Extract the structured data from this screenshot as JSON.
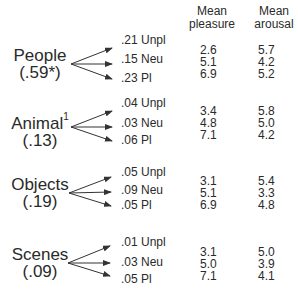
{
  "headers": {
    "pleasure": [
      "Mean",
      "pleasure"
    ],
    "arousal": [
      "Mean",
      "arousal"
    ]
  },
  "groups": [
    {
      "name": "People",
      "superscript": "",
      "proportion": "(.59*)",
      "branches": [
        {
          "prob": ".21",
          "label": "Unpl",
          "pleasure": "2.6",
          "arousal": "5.7"
        },
        {
          "prob": ".15",
          "label": "Neu",
          "pleasure": "5.1",
          "arousal": "4.2"
        },
        {
          "prob": ".23",
          "label": "Pl",
          "pleasure": "6.9",
          "arousal": "5.2"
        }
      ]
    },
    {
      "name": "Animal",
      "superscript": "1",
      "proportion": "(.13)",
      "branches": [
        {
          "prob": ".04",
          "label": "Unpl",
          "pleasure": "3.4",
          "arousal": "5.8"
        },
        {
          "prob": ".03",
          "label": "Neu",
          "pleasure": "4.8",
          "arousal": "5.0"
        },
        {
          "prob": ".06",
          "label": "Pl",
          "pleasure": "7.1",
          "arousal": "4.2"
        }
      ]
    },
    {
      "name": "Objects",
      "superscript": "",
      "proportion": "(.19)",
      "branches": [
        {
          "prob": ".05",
          "label": "Unpl",
          "pleasure": "3.1",
          "arousal": "5.4"
        },
        {
          "prob": ".09",
          "label": "Neu",
          "pleasure": "5.1",
          "arousal": "3.3"
        },
        {
          "prob": ".05",
          "label": "Pl",
          "pleasure": "6.9",
          "arousal": "4.8"
        }
      ]
    },
    {
      "name": "Scenes",
      "superscript": "",
      "proportion": "(.09)",
      "branches": [
        {
          "prob": ".01",
          "label": "Unpl",
          "pleasure": "3.1",
          "arousal": "5.0"
        },
        {
          "prob": ".03",
          "label": "Neu",
          "pleasure": "5.0",
          "arousal": "3.9"
        },
        {
          "prob": ".05",
          "label": "Pl",
          "pleasure": "7.1",
          "arousal": "4.1"
        }
      ]
    }
  ],
  "colors": {
    "text": "#2a2a2a",
    "arrow": "#333333",
    "background": "#ffffff"
  }
}
